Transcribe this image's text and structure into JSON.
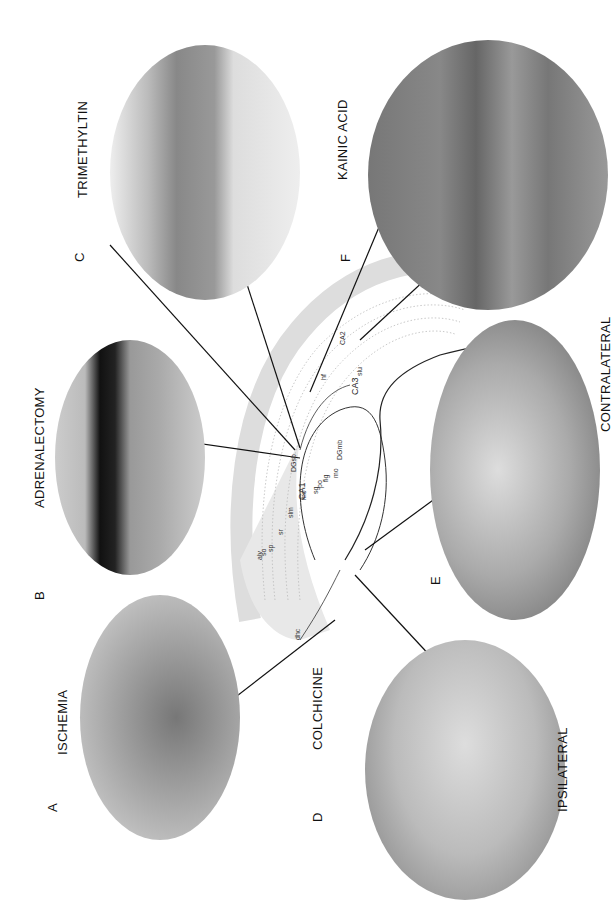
{
  "figure": {
    "orientation": "rotated 90 degrees counter-clockwise",
    "panels": [
      {
        "letter": "A",
        "label": "ISCHEMIA"
      },
      {
        "letter": "B",
        "label": "ADRENALECTOMY"
      },
      {
        "letter": "C",
        "label": "TRIMETHYLTIN"
      },
      {
        "letter": "D",
        "label": "COLCHICINE"
      },
      {
        "letter": "E",
        "label": "CONTRALATERAL",
        "sublabel": "IPSILATERAL"
      },
      {
        "letter": "F",
        "label": "KAINIC ACID"
      }
    ],
    "diagram_labels": {
      "ca1": "CA1",
      "ca3": "CA3",
      "ca2": "CA2",
      "dgsb": "DGsb",
      "dgmb": "DGmb",
      "hf": "hf",
      "mo": "mo",
      "sg": "sg",
      "po": "po",
      "fig": "fig",
      "mo2": "mo",
      "slm": "slm",
      "sr": "sr",
      "sp": "sp",
      "so": "so",
      "alv": "alv",
      "slu": "slu",
      "dhc": "dhc"
    }
  }
}
